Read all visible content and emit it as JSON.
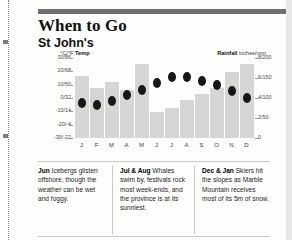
{
  "page": {
    "title": "When to Go",
    "subtitle": "St John's"
  },
  "chart": {
    "legend_temp_unit": "°C/°F ",
    "legend_temp_label": "Temp",
    "legend_rain_label": "Rainfall",
    "legend_rain_unit": " inches/mm"
  },
  "notes": [
    {
      "lead": "Jun",
      "text": " Icebergs glisten offshore, though the weather can be wet and foggy."
    },
    {
      "lead": "Jul & Aug",
      "text": " Whales swim by, festivals rock most week-ends, and the province is at its sunniest."
    },
    {
      "lead": "Dec & Jan",
      "text": " Skiers hit the slopes as Marble Mountain receives most of its 5m of snow."
    }
  ],
  "chart_data": {
    "type": "bar",
    "subtitle": "St John's",
    "xlabel": "",
    "categories": [
      "J",
      "F",
      "M",
      "A",
      "M",
      "J",
      "J",
      "A",
      "S",
      "O",
      "N",
      "D"
    ],
    "grid": true,
    "legend_position": "top",
    "series": [
      {
        "name": "Rainfall",
        "type": "bar",
        "unit": "inches/mm",
        "axis": "right",
        "color": "#d6d6d4",
        "values": [
          155,
          125,
          140,
          120,
          185,
          65,
          75,
          95,
          110,
          125,
          165,
          185
        ]
      },
      {
        "name": "Temp",
        "type": "scatter",
        "unit": "°C/°F",
        "axis": "left",
        "color": "#17171a",
        "values": [
          -4,
          -5,
          -2,
          2,
          6,
          11,
          16,
          16,
          13,
          10,
          5,
          0
        ]
      }
    ],
    "axes": {
      "left": {
        "label": "°C/°F Temp",
        "ylim": [
          -30,
          30
        ],
        "ticks": [
          30,
          20,
          10,
          0,
          -10,
          -20,
          -30
        ],
        "tick_labels": [
          "30/86",
          "20/68",
          "10/50",
          "0/32",
          "-10/14",
          "-20/-4",
          "-30/-22"
        ]
      },
      "right": {
        "label": "Rainfall inches/mm",
        "ylim": [
          0,
          200
        ],
        "ticks": [
          200,
          150,
          100,
          50,
          0
        ],
        "tick_labels": [
          "8/200",
          "6/150",
          "4/100",
          "2/50",
          "0"
        ]
      }
    }
  }
}
